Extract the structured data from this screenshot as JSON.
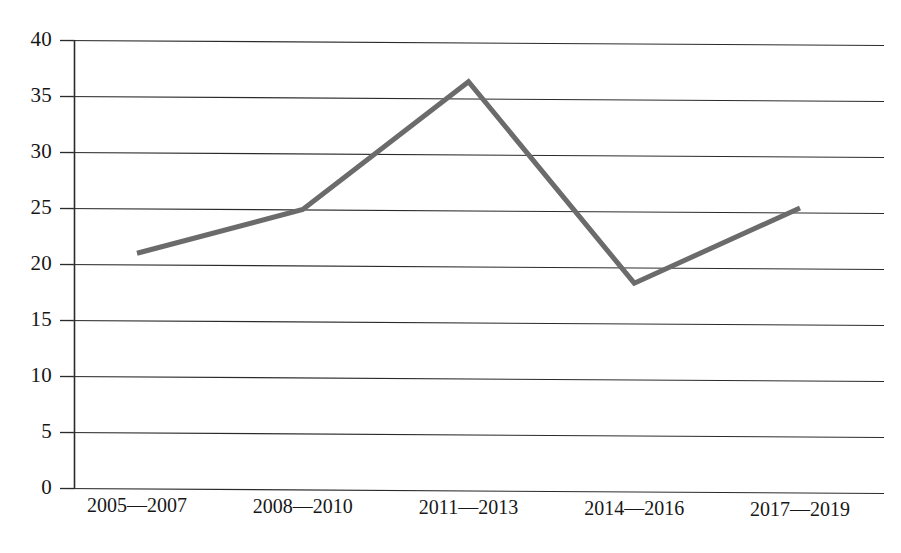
{
  "chart_data": {
    "type": "line",
    "title": "",
    "subtitle": "",
    "xlabel": "",
    "ylabel": "",
    "categories": [
      "2005—2007",
      "2008—2010",
      "2011—2013",
      "2014—2016",
      "2017—2019"
    ],
    "values": [
      21.0,
      25.0,
      36.5,
      18.6,
      25.4
    ],
    "series": [
      {
        "name": "",
        "values": [
          21.0,
          25.0,
          36.5,
          18.6,
          25.4
        ]
      }
    ],
    "ylim": [
      0,
      40
    ],
    "yticks": [
      0,
      5,
      10,
      15,
      20,
      25,
      30,
      35,
      40
    ],
    "ytick_labels": [
      "0",
      "5",
      "10",
      "15",
      "20",
      "25",
      "30",
      "35",
      "40"
    ],
    "grid": true,
    "grid_axis": "y",
    "legend": false,
    "legend_position": "none",
    "line_color": "#6b6b6b",
    "line_width": 5,
    "grid_color": "#2b2b2b",
    "axis_color": "#2b2b2b",
    "background_color": "#ffffff",
    "markers": false
  }
}
